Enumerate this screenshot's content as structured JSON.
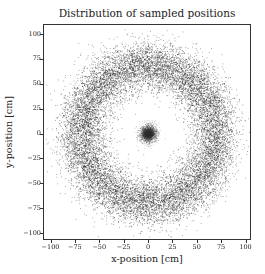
{
  "chart_data": {
    "type": "scatter",
    "title": "Distribution of sampled positions",
    "xlabel": "x-position [cm]",
    "ylabel": "y-position [cm]",
    "xlim": [
      -105,
      105
    ],
    "ylim": [
      -105,
      105
    ],
    "xticks": [
      -100,
      -75,
      -50,
      -25,
      0,
      25,
      50,
      75,
      100
    ],
    "yticks": [
      100,
      75,
      50,
      25,
      0,
      -25,
      -50,
      -75,
      -100
    ],
    "xtick_labels": [
      "−100",
      "−75",
      "−50",
      "−25",
      "0",
      "25",
      "50",
      "75",
      "100"
    ],
    "ytick_labels": [
      "100",
      "75",
      "50",
      "25",
      "0",
      "−25",
      "−50",
      "−75",
      "−100"
    ],
    "grid": false,
    "legend": null,
    "series": [
      {
        "name": "outer ring",
        "distribution": "annulus",
        "center": [
          0,
          0
        ],
        "mean_radius": 70,
        "radial_std": 12,
        "approx_points": 14000,
        "color": "#1a1a1a"
      },
      {
        "name": "central cluster",
        "distribution": "gaussian_disk",
        "center": [
          0,
          0
        ],
        "radius": 9,
        "approx_points": 3000,
        "color": "#333333"
      }
    ]
  }
}
